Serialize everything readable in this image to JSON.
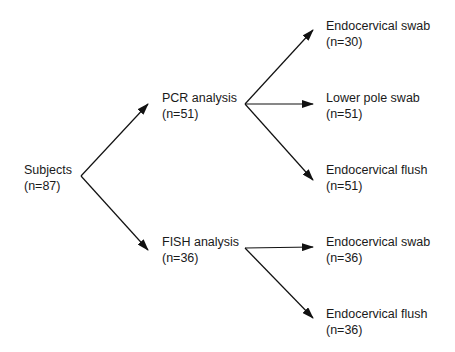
{
  "diagram": {
    "type": "flowchart",
    "root": {
      "label": "Subjects",
      "count": "(n=87)"
    },
    "branches": [
      {
        "label": "PCR analysis",
        "count": "(n=51)",
        "children": [
          {
            "label": "Endocervical swab",
            "count": "(n=30)"
          },
          {
            "label": "Lower pole swab",
            "count": "(n=51)"
          },
          {
            "label": "Endocervical flush",
            "count": "(n=51)"
          }
        ]
      },
      {
        "label": "FISH analysis",
        "count": "(n=36)",
        "children": [
          {
            "label": "Endocervical swab",
            "count": "(n=36)"
          },
          {
            "label": "Endocervical flush",
            "count": "(n=36)"
          }
        ]
      }
    ],
    "colors": {
      "line": "#111111",
      "text": "#1a1a1a",
      "background": "#ffffff"
    }
  }
}
